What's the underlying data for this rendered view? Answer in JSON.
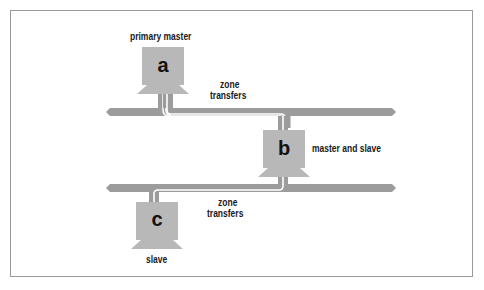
{
  "diagram": {
    "nodes": [
      {
        "id": "a",
        "letter": "a",
        "label": "primary master"
      },
      {
        "id": "b",
        "letter": "b",
        "label": "master and slave"
      },
      {
        "id": "c",
        "letter": "c",
        "label": "slave"
      }
    ],
    "edges": [
      {
        "from": "a",
        "to": "b",
        "label_line1": "zone",
        "label_line2": "transfers"
      },
      {
        "from": "b",
        "to": "c",
        "label_line1": "zone",
        "label_line2": "transfers"
      }
    ],
    "networks": [
      "upper-network",
      "lower-network"
    ],
    "colors": {
      "computer": "#b8b8b8",
      "network": "#9c9c9c",
      "transfer_line": "#ffffff",
      "frame": "#9a9a9a",
      "text": "#1a1a1a"
    }
  }
}
